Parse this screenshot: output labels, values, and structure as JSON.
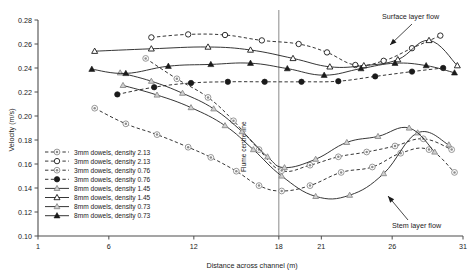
{
  "chart_data": {
    "type": "line",
    "title": "",
    "xlabel": "Distance across channel (m)",
    "ylabel": "Velocity (m/s)",
    "xlim": [
      1,
      31
    ],
    "ylim": [
      0.1,
      0.28
    ],
    "xticks": [
      1,
      6,
      12,
      18,
      21,
      26,
      31
    ],
    "yticks": [
      0.1,
      0.12,
      0.14,
      0.16,
      0.18,
      0.2,
      0.22,
      0.24,
      0.26,
      0.28
    ],
    "grid": false,
    "legend_position": "lower-left-inside",
    "annotations": [
      {
        "text": "Surface layer flow",
        "x": 27.0,
        "y": 0.272
      },
      {
        "text": "Stem layer flow",
        "x": 27.4,
        "y": 0.123
      },
      {
        "text": "Flume centre line",
        "x": 18,
        "y": 0.19,
        "rotated": true
      }
    ],
    "series": [
      {
        "name": "3mm dowels, density 2.13",
        "layer": "stem",
        "line": "dashed",
        "marker": "circle-dot",
        "x": [
          5.0,
          7.2,
          9.4,
          11.6,
          13.2,
          15.0,
          16.6,
          18.2,
          20.2,
          22.4,
          24.6,
          26.6,
          28.6,
          30.4
        ],
        "y": [
          0.2065,
          0.1935,
          0.1845,
          0.174,
          0.1655,
          0.154,
          0.142,
          0.1375,
          0.142,
          0.153,
          0.1575,
          0.169,
          0.172,
          0.153
        ]
      },
      {
        "name": "3mm dowels, density 2.13",
        "layer": "surface",
        "line": "dashed",
        "marker": "circle-open",
        "x": [
          9.0,
          11.6,
          14.2,
          16.8,
          19.4,
          21.4,
          23.4,
          25.4,
          27.4,
          29.4
        ],
        "y": [
          0.2655,
          0.268,
          0.2675,
          0.263,
          0.26,
          0.253,
          0.2425,
          0.246,
          0.2565,
          0.267
        ]
      },
      {
        "name": "3mm dowels, density 0.76",
        "layer": "stem",
        "line": "dashed",
        "marker": "circle-dot-gray",
        "x": [
          8.6,
          10.8,
          13.0,
          14.8,
          16.6,
          18.2,
          20.2,
          22.2,
          24.2,
          26.2,
          28.2,
          30.2
        ],
        "y": [
          0.248,
          0.231,
          0.2155,
          0.196,
          0.172,
          0.1545,
          0.159,
          0.166,
          0.17,
          0.175,
          0.181,
          0.172
        ]
      },
      {
        "name": "3mm dowels, density 0.76",
        "layer": "surface",
        "line": "dashed",
        "marker": "circle-filled",
        "x": [
          6.6,
          9.2,
          11.8,
          14.4,
          17.0,
          19.6,
          22.2,
          24.8,
          27.4,
          29.6
        ],
        "y": [
          0.218,
          0.224,
          0.2275,
          0.2285,
          0.2285,
          0.2285,
          0.229,
          0.233,
          0.237,
          0.24
        ]
      },
      {
        "name": "8mm dowels, density 1.45",
        "layer": "stem",
        "line": "solid",
        "marker": "triangle-gray",
        "x": [
          7.0,
          9.4,
          11.8,
          14.2,
          16.2,
          18.2,
          20.6,
          23.0,
          25.4,
          27.8,
          30.0
        ],
        "y": [
          0.2255,
          0.2175,
          0.207,
          0.192,
          0.172,
          0.15,
          0.133,
          0.134,
          0.152,
          0.186,
          0.176
        ]
      },
      {
        "name": "8mm dowels, density 1.45",
        "layer": "surface",
        "line": "solid",
        "marker": "triangle-open",
        "x": [
          5.0,
          9.0,
          13.0,
          16.0,
          19.0,
          21.6,
          24.0,
          26.4,
          28.6,
          30.6
        ],
        "y": [
          0.254,
          0.256,
          0.2575,
          0.255,
          0.248,
          0.241,
          0.242,
          0.247,
          0.263,
          0.242
        ]
      },
      {
        "name": "8mm dowels, density 0.73",
        "layer": "stem",
        "line": "solid",
        "marker": "triangle-gray-small",
        "x": [
          6.8,
          9.0,
          11.2,
          13.4,
          15.4,
          17.2,
          18.4,
          20.6,
          22.8,
          25.0,
          27.2,
          29.0
        ],
        "y": [
          0.236,
          0.229,
          0.219,
          0.206,
          0.187,
          0.166,
          0.157,
          0.164,
          0.178,
          0.183,
          0.19,
          0.17
        ]
      },
      {
        "name": "8mm dowels, density 0.73",
        "layer": "surface",
        "line": "solid",
        "marker": "triangle-filled",
        "x": [
          4.8,
          7.2,
          10.2,
          13.2,
          16.0,
          18.6,
          21.2,
          23.8,
          26.2,
          28.4,
          30.4
        ],
        "y": [
          0.239,
          0.2355,
          0.2415,
          0.243,
          0.244,
          0.2395,
          0.234,
          0.2395,
          0.244,
          0.242,
          0.236
        ]
      }
    ],
    "legend_entries": [
      {
        "label": "3mm dowels, density 2.13",
        "line": "dashed",
        "marker": "circle-dot"
      },
      {
        "label": "3mm dowels, density 2.13",
        "line": "dashed",
        "marker": "circle-open"
      },
      {
        "label": "3mm dowels, density 0.76",
        "line": "dashed",
        "marker": "circle-dot-gray"
      },
      {
        "label": "3mm dowels, density 0.76",
        "line": "dashed",
        "marker": "circle-filled"
      },
      {
        "label": "8mm dowels, density 1.45",
        "line": "solid",
        "marker": "triangle-gray"
      },
      {
        "label": "8mm dowels, density 1.45",
        "line": "solid",
        "marker": "triangle-open"
      },
      {
        "label": "8mm dowels, density 0.73",
        "line": "solid",
        "marker": "triangle-gray-small"
      },
      {
        "label": "8mm dowels, density 0.73",
        "line": "solid",
        "marker": "triangle-filled"
      }
    ]
  },
  "colors": {
    "axis": "#4d4d4d",
    "line": "#2b2b2b",
    "marker_gray": "#8c8c8c",
    "marker_fill_dark": "#1a1a1a",
    "background": "#ffffff"
  }
}
